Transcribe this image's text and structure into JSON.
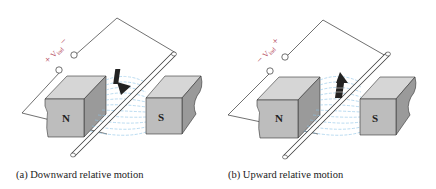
{
  "figure": {
    "panels": [
      {
        "id": "a",
        "caption": "(a)  Downward relative motion",
        "voltage_label": "+ Vind −",
        "voltage_symbol": "V",
        "voltage_subscript": "ind",
        "polarity_left": "+",
        "polarity_right": "−",
        "north_label": "N",
        "south_label": "S",
        "motion_direction": "down"
      },
      {
        "id": "b",
        "caption": "(b)  Upward relative motion",
        "voltage_label": "− Vind +",
        "voltage_symbol": "V",
        "voltage_subscript": "ind",
        "polarity_left": "−",
        "polarity_right": "+",
        "north_label": "N",
        "south_label": "S",
        "motion_direction": "up"
      }
    ],
    "colors": {
      "magnet_face": "#bdbdbd",
      "magnet_top": "#d6d6d6",
      "magnet_side": "#9a9a9a",
      "field_lines": "#8cc3e6",
      "label_color": "#b5485b",
      "wire": "#333333"
    }
  }
}
